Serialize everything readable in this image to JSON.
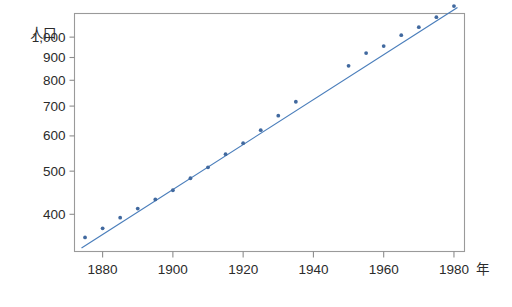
{
  "figure": {
    "background_color": "#ffffff",
    "frame_color": "#9a9a9a",
    "accent_color": "#4a7ebb",
    "marker_color": "#41699f"
  },
  "axes": {
    "y_axis_name": "人口",
    "x_axis_name": "年",
    "y_tick_labels": [
      "1,000",
      "900",
      "800",
      "700",
      "600",
      "500",
      "400"
    ],
    "x_tick_labels": [
      "1880",
      "1900",
      "1920",
      "1940",
      "1960",
      "1980"
    ]
  },
  "chart_data": {
    "type": "scatter",
    "title": "",
    "subtitle": "",
    "xlabel": "年",
    "ylabel": "人口",
    "yscale": "log",
    "xscale": "linear",
    "grid": false,
    "legend": "none",
    "xlim": [
      1872,
      1983
    ],
    "ylim": [
      330,
      1130
    ],
    "xticks": [
      1880,
      1900,
      1920,
      1940,
      1960,
      1980
    ],
    "xticklabels": [
      "1880",
      "1900",
      "1920",
      "1940",
      "1960",
      "1980"
    ],
    "yticks": [
      400,
      500,
      600,
      700,
      800,
      900,
      1000
    ],
    "yticklabels": [
      "400",
      "500",
      "600",
      "700",
      "800",
      "900",
      "1,000"
    ],
    "series": [
      {
        "name": "人口",
        "type": "scatter",
        "marker": "point",
        "color": "#41699f",
        "x": [
          1875,
          1880,
          1885,
          1890,
          1895,
          1900,
          1905,
          1910,
          1915,
          1920,
          1925,
          1930,
          1935,
          1950,
          1955,
          1960,
          1965,
          1970,
          1975,
          1980
        ],
        "y": [
          355,
          372,
          393,
          412,
          432,
          453,
          482,
          510,
          546,
          578,
          618,
          666,
          716,
          862,
          921,
          955,
          1010,
          1053,
          1109,
          1174
        ]
      },
      {
        "name": "回帰直線",
        "type": "line",
        "color": "#4a7ebb",
        "x": [
          1874,
          1981
        ],
        "y": [
          336,
          1166
        ]
      }
    ],
    "annotations": []
  }
}
